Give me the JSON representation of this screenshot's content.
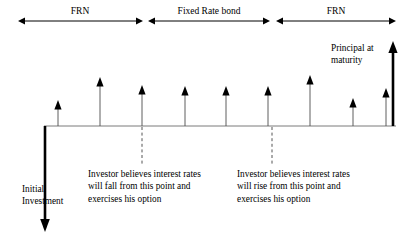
{
  "diagram": {
    "colors": {
      "line": "#000000",
      "axis": "#7a7a7a",
      "dashed": "#555555",
      "text": "#000000",
      "background": "#ffffff"
    },
    "phases": [
      {
        "id": "phase-frn-1",
        "label": "FRN",
        "x_start": 18,
        "x_end": 143,
        "y": 21,
        "label_x": 80,
        "label_y": 7,
        "arrow_start": true,
        "arrow_end": true
      },
      {
        "id": "phase-fixed-rate-bond",
        "label": "Fixed Rate bond",
        "x_start": 148,
        "x_end": 270,
        "y": 21,
        "label_x": 209,
        "label_y": 7,
        "arrow_start": true,
        "arrow_end": true
      },
      {
        "id": "phase-frn-2",
        "label": "FRN",
        "x_start": 276,
        "x_end": 396,
        "y": 21,
        "label_x": 336,
        "label_y": 7,
        "arrow_start": true,
        "arrow_end": true
      }
    ],
    "baseline": {
      "name": "time-axis",
      "x_start": 44,
      "x_end": 396,
      "y": 126
    },
    "coupons": [
      {
        "id": "coupon-1",
        "x": 58,
        "tip_y": 100,
        "base_y": 126,
        "height_px": 26
      },
      {
        "id": "coupon-2",
        "x": 100,
        "tip_y": 77,
        "base_y": 126,
        "height_px": 49
      },
      {
        "id": "coupon-3",
        "x": 142,
        "tip_y": 85,
        "base_y": 126,
        "height_px": 41
      },
      {
        "id": "coupon-4",
        "x": 185,
        "tip_y": 86,
        "base_y": 126,
        "height_px": 40
      },
      {
        "id": "coupon-5",
        "x": 226,
        "tip_y": 86,
        "base_y": 126,
        "height_px": 40
      },
      {
        "id": "coupon-6",
        "x": 268,
        "tip_y": 86,
        "base_y": 126,
        "height_px": 40
      },
      {
        "id": "coupon-7",
        "x": 310,
        "tip_y": 75,
        "base_y": 126,
        "height_px": 51
      },
      {
        "id": "coupon-8",
        "x": 353,
        "tip_y": 98,
        "base_y": 126,
        "height_px": 28
      },
      {
        "id": "coupon-9",
        "x": 386,
        "tip_y": 88,
        "base_y": 126,
        "height_px": 38
      }
    ],
    "principal": {
      "name": "principal-arrow",
      "label_line_1": "Principal at",
      "label_line_2": "maturity",
      "label_x": 331,
      "label_y": 42,
      "x": 393,
      "tip_y": 41,
      "base_y": 126
    },
    "initial_investment": {
      "name": "initial-investment-arrow",
      "label_line_1": "Initial",
      "label_line_2": "Investment",
      "label_x": 22,
      "label_y": 183,
      "x": 45,
      "top_y": 126,
      "tip_y": 232
    },
    "callouts": [
      {
        "id": "callout-rates-fall",
        "dashed_x": 142,
        "dashed_top_y": 127,
        "dashed_bottom_y": 166,
        "text_x": 88,
        "text_y": 168,
        "lines": [
          "Investor believes interest rates",
          "will fall from this point and",
          "exercises his option"
        ]
      },
      {
        "id": "callout-rates-rise",
        "dashed_x": 272,
        "dashed_top_y": 127,
        "dashed_bottom_y": 166,
        "text_x": 237,
        "text_y": 168,
        "lines": [
          "Investor believes interest rates",
          "will rise from this point and",
          "exercises his option"
        ]
      }
    ]
  }
}
